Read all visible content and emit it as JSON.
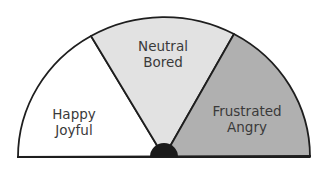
{
  "diagram": {
    "type": "semicircle-mood-gauge",
    "segments": [
      {
        "id": "left",
        "lines": [
          "Happy",
          "Joyful"
        ],
        "fill": "#ffffff"
      },
      {
        "id": "middle",
        "lines": [
          "Neutral",
          "Bored"
        ],
        "fill": "#e2e2e2"
      },
      {
        "id": "right",
        "lines": [
          "Frustrated",
          "Angry"
        ],
        "fill": "#b0b0b0"
      }
    ],
    "outline_color": "#1e1e1e",
    "hub_color": "#1a1a1a"
  }
}
